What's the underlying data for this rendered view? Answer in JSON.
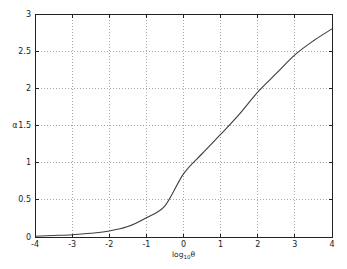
{
  "figure": {
    "background": "#ffffff",
    "axis_color": "#222222",
    "grid_color": "#a8a8a8",
    "line_color": "#3d3d3d",
    "tick_label_color": "#222222"
  },
  "chart_data": {
    "type": "line",
    "title": "",
    "xlabel": {
      "prefix": "log",
      "subscript": "10",
      "argument": "θ"
    },
    "ylabel": "α",
    "xlim": [
      -4,
      4
    ],
    "ylim": [
      0,
      3
    ],
    "grid": "dotted",
    "legend": "none",
    "xticks": {
      "values": [
        -4,
        -3,
        -2,
        -1,
        0,
        1,
        2,
        3,
        4
      ],
      "labels": [
        "-4",
        "-3",
        "-2",
        "-1",
        "0",
        "1",
        "2",
        "3",
        "4"
      ]
    },
    "yticks": {
      "values": [
        0,
        0.5,
        1,
        1.5,
        2,
        2.5,
        3
      ],
      "labels": [
        "0",
        "0.5",
        "1",
        "1.5",
        "2",
        "2.5",
        "3"
      ]
    },
    "series": [
      {
        "name": "alpha-vs-log-theta",
        "x": [
          -4,
          -3.5,
          -3,
          -2.5,
          -2,
          -1.5,
          -1,
          -0.5,
          0,
          0.5,
          1,
          1.5,
          2,
          2.5,
          3,
          3.5,
          4
        ],
        "y": [
          0.01,
          0.02,
          0.03,
          0.05,
          0.08,
          0.14,
          0.26,
          0.42,
          0.85,
          1.12,
          1.38,
          1.65,
          1.95,
          2.2,
          2.45,
          2.64,
          2.8
        ]
      }
    ]
  }
}
